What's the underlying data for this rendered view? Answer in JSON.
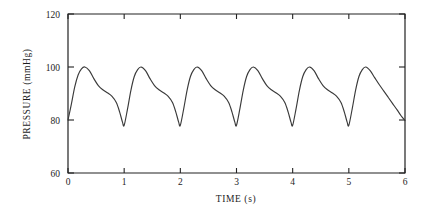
{
  "chart_data": {
    "type": "line",
    "title": "",
    "subtitle": "",
    "xlabel": "TIME (s)",
    "ylabel": "PRESSURE (mmHg)",
    "xlim": [
      0,
      6
    ],
    "ylim": [
      60,
      120
    ],
    "xticks": [
      0,
      1,
      2,
      3,
      4,
      5,
      6
    ],
    "xtick_labels": [
      "0",
      "1",
      "2",
      "3",
      "4",
      "5",
      "6"
    ],
    "yticks": [
      60,
      80,
      100,
      120
    ],
    "ytick_labels": [
      "60",
      "80",
      "100",
      "120"
    ],
    "grid": false,
    "legend": null,
    "annotations": [],
    "series": [
      {
        "name": "arterial pressure",
        "color": "#3a3a3a",
        "systolic_peak": 100,
        "diastolic_trough": 78,
        "cycle_period_s": 1.0,
        "cycles": 6,
        "x": [
          0.0,
          0.06,
          0.12,
          0.18,
          0.24,
          0.3,
          0.38,
          0.46,
          0.54,
          0.62,
          0.7,
          0.78,
          0.86,
          0.92,
          0.97,
          1.0,
          1.06,
          1.12,
          1.18,
          1.24,
          1.3,
          1.38,
          1.46,
          1.54,
          1.62,
          1.7,
          1.78,
          1.86,
          1.92,
          1.97,
          2.0,
          2.06,
          2.12,
          2.18,
          2.24,
          2.3,
          2.38,
          2.46,
          2.54,
          2.62,
          2.7,
          2.78,
          2.86,
          2.92,
          2.97,
          3.0,
          3.06,
          3.12,
          3.18,
          3.24,
          3.3,
          3.38,
          3.46,
          3.54,
          3.62,
          3.7,
          3.78,
          3.86,
          3.92,
          3.97,
          4.0,
          4.06,
          4.12,
          4.18,
          4.24,
          4.3,
          4.38,
          4.46,
          4.54,
          4.62,
          4.7,
          4.78,
          4.86,
          4.92,
          4.97,
          5.0,
          5.06,
          5.12,
          5.18,
          5.24,
          5.3,
          5.38,
          5.46,
          5.54,
          5.62,
          5.7,
          5.78,
          5.86,
          5.93,
          6.0
        ],
        "y": [
          80.0,
          86.0,
          92.5,
          97.0,
          99.3,
          100.0,
          98.6,
          95.6,
          93.0,
          91.4,
          90.3,
          89.0,
          86.6,
          83.0,
          79.2,
          78.0,
          84.2,
          91.2,
          96.4,
          99.0,
          100.0,
          98.6,
          95.6,
          93.0,
          91.4,
          90.3,
          89.0,
          86.6,
          83.0,
          79.2,
          78.0,
          84.2,
          91.2,
          96.4,
          99.0,
          100.0,
          98.6,
          95.6,
          93.0,
          91.4,
          90.3,
          89.0,
          86.6,
          83.0,
          79.2,
          78.0,
          84.2,
          91.2,
          96.4,
          99.0,
          100.0,
          98.6,
          95.6,
          93.0,
          91.4,
          90.3,
          89.0,
          86.6,
          83.0,
          79.2,
          78.0,
          84.2,
          91.2,
          96.4,
          99.0,
          100.0,
          98.6,
          95.6,
          93.0,
          91.4,
          90.3,
          89.0,
          86.6,
          83.0,
          79.2,
          78.0,
          84.2,
          91.2,
          96.4,
          99.0,
          100.0,
          98.6,
          96.0,
          93.4,
          91.0,
          88.6,
          86.2,
          83.8,
          81.6,
          79.8
        ]
      }
    ]
  },
  "axes": {
    "y_title": "PRESSURE (mmHg)",
    "x_title": "TIME (s)"
  }
}
